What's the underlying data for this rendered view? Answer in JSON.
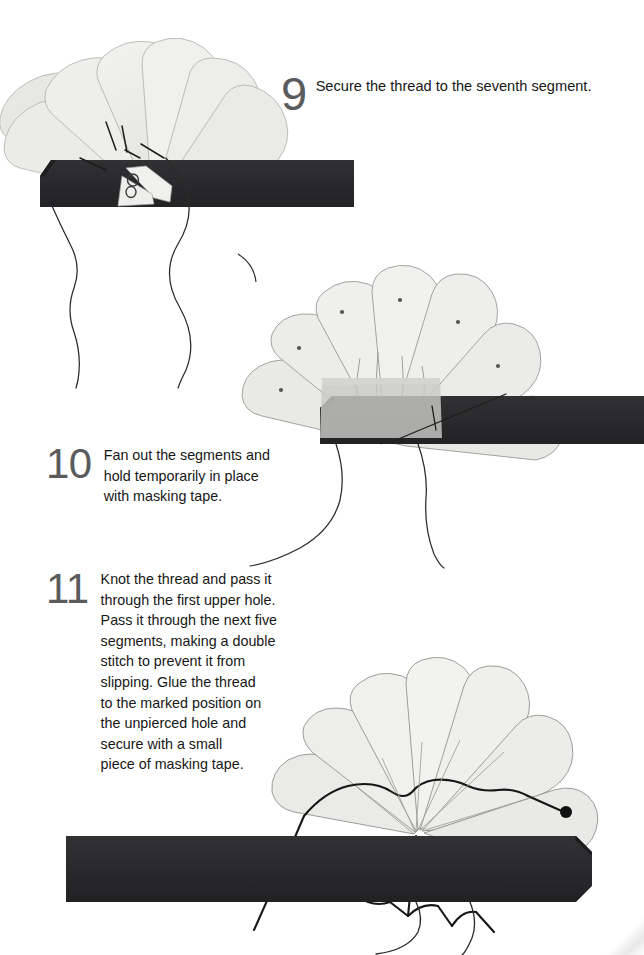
{
  "document": {
    "type": "craft-instruction-sheet",
    "background_color": "#ffffff"
  },
  "palette": {
    "paper_segment": "#eeeeec",
    "paper_segment_shade": "#e2e2df",
    "segment_outline": "#9a9a98",
    "card_strip": "#2b2b2d",
    "card_strip_edge": "#1c1c1e",
    "masking_tape": "#c8c8c6",
    "thread": "#1b1b1b",
    "step_number": "#5a5b5d",
    "body_text": "#161616"
  },
  "steps": [
    {
      "number": "9",
      "lines": [
        "Secure the thread to the seventh segment."
      ]
    },
    {
      "number": "10",
      "lines": [
        "Fan out the segments and",
        "hold temporarily in place",
        "with masking tape."
      ]
    },
    {
      "number": "11",
      "lines": [
        "Knot the thread and pass it",
        "through the first upper hole.",
        "Pass it through the next five",
        "segments, making a double",
        "stitch to prevent it from",
        "slipping. Glue the thread",
        "to the marked position on",
        "the unpierced hole and",
        "secure with a small",
        "piece of masking tape."
      ]
    }
  ],
  "illustrations": [
    {
      "id": "illustration-step-9",
      "caption_step": "9",
      "description": "Stack of pale paper segments partially fanned, pivoting at a point, resting on a dark card strip, with thread knotted at the pivot and two loose thread ends trailing down.",
      "segment_count": 7,
      "strip": {
        "color": "#2b2b2d",
        "left_end": "beveled",
        "right_end": "square"
      },
      "threads_trailing": 2
    },
    {
      "id": "illustration-step-10",
      "caption_step": "10",
      "description": "Segments fanned out into a wide shell, each pierced with a small hole, held at the base by a translucent masking tape patch on a dark card strip.",
      "segment_count": 7,
      "holes_visible": 6,
      "masking_tape": {
        "color": "#c8c8c6",
        "position": "base-centre"
      },
      "strip": {
        "color": "#2b2b2d",
        "left_end": "beveled",
        "right_end": "square"
      },
      "threads_trailing": 2
    },
    {
      "id": "illustration-step-11",
      "caption_step": "11",
      "description": "Fanned shell with thread stitched in a zig-zag across the upper holes of six segments, ending at a marked glue dot on the seventh segment, mounted on a long dark card strip with two threads trailing below.",
      "segment_count": 7,
      "glue_mark": {
        "label": "marked position",
        "color": "#111111"
      },
      "strip": {
        "color": "#2b2b2d",
        "left_end": "square",
        "right_end": "beveled"
      },
      "threads_trailing": 2
    }
  ]
}
